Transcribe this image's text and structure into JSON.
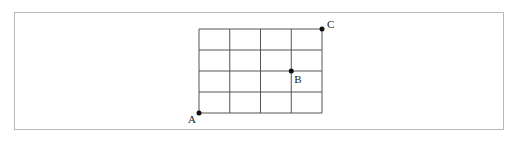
{
  "diagram": {
    "type": "grid",
    "columns": 4,
    "rows": 4,
    "origin": {
      "x": 199,
      "y": 29
    },
    "cell_width": 30.75,
    "cell_height": 21,
    "line_color": "#555555",
    "points": [
      {
        "id": "A",
        "label": "A",
        "col": 0,
        "row": 4
      },
      {
        "id": "B",
        "label": "B",
        "col": 3,
        "row": 2
      },
      {
        "id": "C",
        "label": "C",
        "col": 4,
        "row": 0
      }
    ]
  }
}
